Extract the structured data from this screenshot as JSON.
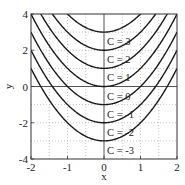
{
  "chart_data": {
    "type": "line",
    "title": "",
    "xlabel": "x",
    "ylabel": "y",
    "xlim": [
      -2,
      2
    ],
    "ylim": [
      -4,
      4
    ],
    "xticks": [
      -2,
      -1,
      0,
      1,
      2
    ],
    "xtick_labels": [
      "-2",
      "-1",
      "0",
      "1",
      "2"
    ],
    "yticks": [
      -4,
      -2,
      0,
      2,
      4
    ],
    "ytick_labels": [
      "-4",
      "-2",
      "0",
      "2",
      "4"
    ],
    "grid": true,
    "grid_x_step": 0.5,
    "grid_y_step": 1,
    "function": "y = x^2 + C",
    "series": [
      {
        "name": "C = 3",
        "C": 3
      },
      {
        "name": "C = 2",
        "C": 2
      },
      {
        "name": "C = 1",
        "C": 1
      },
      {
        "name": "C = 0",
        "C": 0
      },
      {
        "name": "C = -1",
        "C": -1
      },
      {
        "name": "C = -2",
        "C": -2
      },
      {
        "name": "C = -3",
        "C": -3
      }
    ],
    "annotations": [
      "C = 3",
      "C = 2",
      "C = 1",
      "C = 0",
      "C = -1",
      "C = -2",
      "C = -3"
    ],
    "legend": "none (inline labels right of x = 0)",
    "colors": {
      "curve": "#1a1a1a",
      "axis": "#333333",
      "grid": "#aaaaaa"
    }
  }
}
